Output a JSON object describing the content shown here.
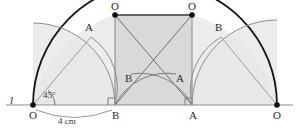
{
  "figure": {
    "type": "geometry-construction-diagram",
    "caption_colors": {
      "stroke_dark": "#1a1a1a",
      "stroke_medium": "#7a7a7a",
      "stroke_light": "#9a9a9a",
      "fill_light": "#e6e6e6",
      "fill_mid": "#dcdcdc",
      "fill_dark": "#d0d0d0",
      "text": "#2b2b2b",
      "background": "#ffffff"
    },
    "baseline_label": "l",
    "angle_label": "45°",
    "dimension_label": "4 cm",
    "points": [
      {
        "id": "O-left",
        "label": "O",
        "x": 33,
        "y": 105,
        "label_dx": -4,
        "label_dy": 14,
        "dot": true
      },
      {
        "id": "B-bottom",
        "label": "B",
        "x": 115,
        "y": 105,
        "label_dx": -3,
        "label_dy": 14,
        "dot": false
      },
      {
        "id": "A-bottom",
        "label": "A",
        "x": 192,
        "y": 105,
        "label_dx": -3,
        "label_dy": 14,
        "dot": false
      },
      {
        "id": "O-right",
        "label": "O",
        "x": 277,
        "y": 105,
        "label_dx": -4,
        "label_dy": 14,
        "dot": true
      },
      {
        "id": "O-top-left",
        "label": "O",
        "x": 115,
        "y": 15,
        "label_dx": -4,
        "label_dy": -5,
        "dot": true
      },
      {
        "id": "O-top-right",
        "label": "O",
        "x": 192,
        "y": 15,
        "label_dx": -4,
        "label_dy": -5,
        "dot": true
      },
      {
        "id": "A-left-arc",
        "label": "A",
        "x": 89,
        "y": 35,
        "label_dx": -4,
        "label_dy": -4,
        "dot": false
      },
      {
        "id": "B-mid",
        "label": "B",
        "x": 135,
        "y": 78,
        "label_dx": -10,
        "label_dy": 4,
        "dot": false
      },
      {
        "id": "A-mid",
        "label": "A",
        "x": 172,
        "y": 78,
        "label_dx": 4,
        "label_dy": 4,
        "dot": false
      },
      {
        "id": "B-right-arc",
        "label": "B",
        "x": 219,
        "y": 35,
        "label_dx": -4,
        "label_dy": -4,
        "dot": false
      }
    ]
  }
}
